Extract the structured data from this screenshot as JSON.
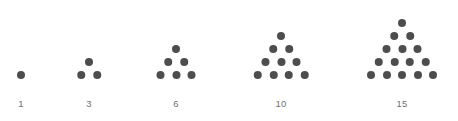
{
  "figure": {
    "background_color": "#ffffff",
    "dot_color": "#4d4d4d",
    "label_color": "#6f6f6f",
    "dot_diameter_px": 8,
    "row_spacing_px": 13,
    "column_spacing_px": 15.5,
    "baseline_y_px": 75
  },
  "chart_data": {
    "type": "scatter",
    "title": "",
    "subtitle": "",
    "xlabel": "",
    "ylabel": "",
    "grid": false,
    "legend": null,
    "annotations": [],
    "categories": [
      "1",
      "3",
      "6",
      "10",
      "15"
    ],
    "values": [
      1,
      3,
      6,
      10,
      15
    ],
    "series": [
      {
        "name": "triangular numbers",
        "values": [
          1,
          3,
          6,
          10,
          15
        ]
      }
    ],
    "figures": [
      {
        "label": "1",
        "dot_count": 1,
        "rows": 1,
        "row_counts": [
          1
        ],
        "center_x": 21,
        "label_y": 98
      },
      {
        "label": "3",
        "dot_count": 3,
        "rows": 2,
        "row_counts": [
          1,
          2
        ],
        "center_x": 89,
        "label_y": 98
      },
      {
        "label": "6",
        "dot_count": 6,
        "rows": 3,
        "row_counts": [
          1,
          2,
          3
        ],
        "center_x": 176,
        "label_y": 98
      },
      {
        "label": "10",
        "dot_count": 10,
        "rows": 4,
        "row_counts": [
          1,
          2,
          3,
          4
        ],
        "center_x": 281,
        "label_y": 98
      },
      {
        "label": "15",
        "dot_count": 15,
        "rows": 5,
        "row_counts": [
          1,
          2,
          3,
          4,
          5
        ],
        "center_x": 402,
        "label_y": 98
      }
    ]
  }
}
